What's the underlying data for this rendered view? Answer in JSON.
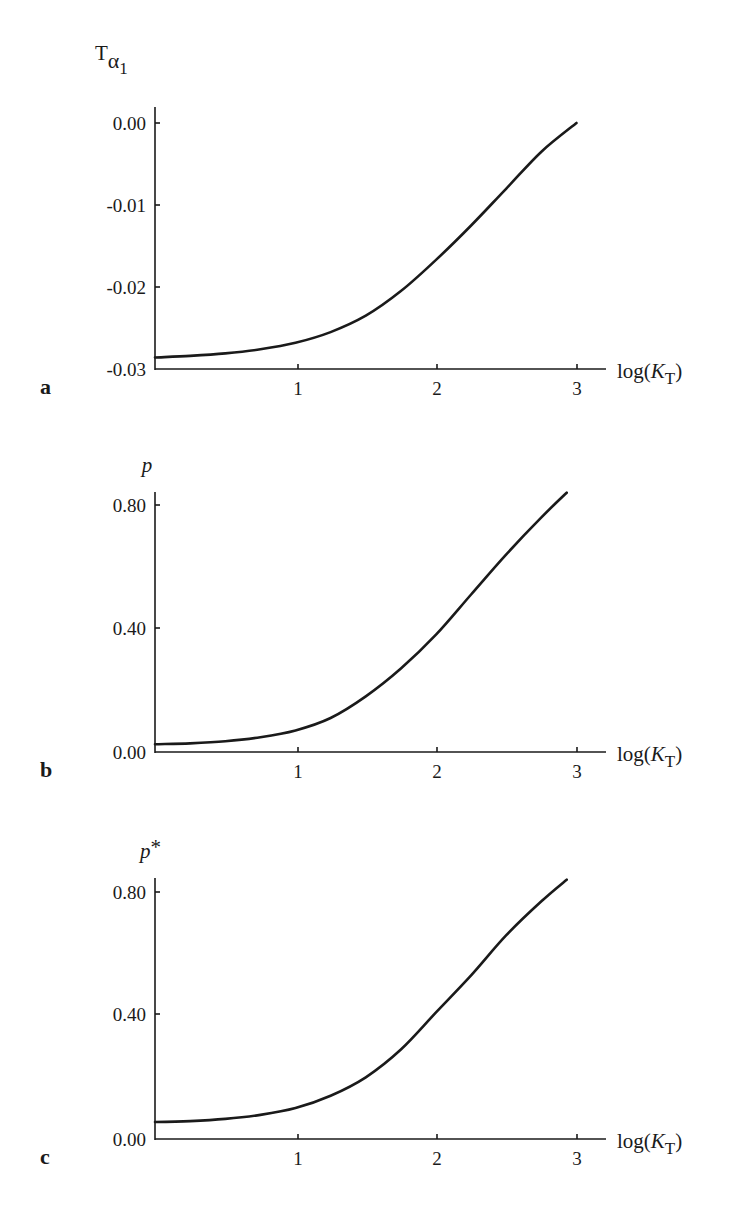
{
  "chart_data": [
    {
      "panel": "a",
      "type": "line",
      "title": "",
      "xlabel": "log(K_T)",
      "ylabel": "T_α1",
      "x_ticks": [
        "1",
        "2",
        "3"
      ],
      "y_ticks": [
        "0.00",
        "-0.01",
        "-0.02",
        "-0.03"
      ],
      "xlim": [
        0,
        3.2
      ],
      "ylim": [
        -0.03,
        0.0
      ],
      "grid": false,
      "x": [
        0,
        0.25,
        0.5,
        0.75,
        1,
        1.25,
        1.5,
        1.75,
        2,
        2.25,
        2.5,
        2.75,
        3
      ],
      "values": [
        -0.0286,
        -0.0284,
        -0.0281,
        -0.0276,
        -0.0268,
        -0.0255,
        -0.0235,
        -0.0205,
        -0.0167,
        -0.0125,
        -0.008,
        -0.0035,
        0.0
      ]
    },
    {
      "panel": "b",
      "type": "line",
      "title": "",
      "xlabel": "log(K_T)",
      "ylabel": "p",
      "x_ticks": [
        "1",
        "2",
        "3"
      ],
      "y_ticks": [
        "0.80",
        "0.40",
        "0.00"
      ],
      "xlim": [
        0,
        3.2
      ],
      "ylim": [
        0.0,
        0.85
      ],
      "grid": false,
      "x": [
        0,
        0.25,
        0.5,
        0.75,
        1,
        1.25,
        1.5,
        1.75,
        2,
        2.25,
        2.5,
        2.75,
        2.93
      ],
      "values": [
        0.025,
        0.028,
        0.035,
        0.048,
        0.07,
        0.11,
        0.18,
        0.27,
        0.38,
        0.51,
        0.64,
        0.76,
        0.84
      ]
    },
    {
      "panel": "c",
      "type": "line",
      "title": "",
      "xlabel": "log(K_T)",
      "ylabel": "p*",
      "x_ticks": [
        "1",
        "2",
        "3"
      ],
      "y_ticks": [
        "0.80",
        "0.40",
        "0.00"
      ],
      "xlim": [
        0,
        3.2
      ],
      "ylim": [
        0.0,
        0.85
      ],
      "grid": false,
      "x": [
        0,
        0.25,
        0.5,
        0.75,
        1,
        1.25,
        1.5,
        1.75,
        2,
        2.25,
        2.5,
        2.75,
        2.93
      ],
      "values": [
        0.055,
        0.058,
        0.065,
        0.078,
        0.1,
        0.14,
        0.2,
        0.29,
        0.41,
        0.53,
        0.66,
        0.77,
        0.84
      ]
    }
  ],
  "panels": {
    "a": {
      "letter": "a",
      "ylabel_main": "T",
      "ylabel_sub": "α",
      "ylabel_subsub": "1",
      "xlabel_pre": "log(",
      "xlabel_k": "K",
      "xlabel_sub": "T",
      "xlabel_post": ")",
      "yt0": "0.00",
      "yt1": "-0.01",
      "yt2": "-0.02",
      "yt3": "-0.03",
      "xt1": "1",
      "xt2": "2",
      "xt3": "3"
    },
    "b": {
      "letter": "b",
      "ylabel": "p",
      "xlabel_pre": "log(",
      "xlabel_k": "K",
      "xlabel_sub": "T",
      "xlabel_post": ")",
      "yt0": "0.80",
      "yt1": "0.40",
      "yt2": "0.00",
      "xt1": "1",
      "xt2": "2",
      "xt3": "3"
    },
    "c": {
      "letter": "c",
      "ylabel": "p",
      "ylabel_star": "*",
      "xlabel_pre": "log(",
      "xlabel_k": "K",
      "xlabel_sub": "T",
      "xlabel_post": ")",
      "yt0": "0.80",
      "yt1": "0.40",
      "yt2": "0.00",
      "xt1": "1",
      "xt2": "2",
      "xt3": "3"
    }
  }
}
